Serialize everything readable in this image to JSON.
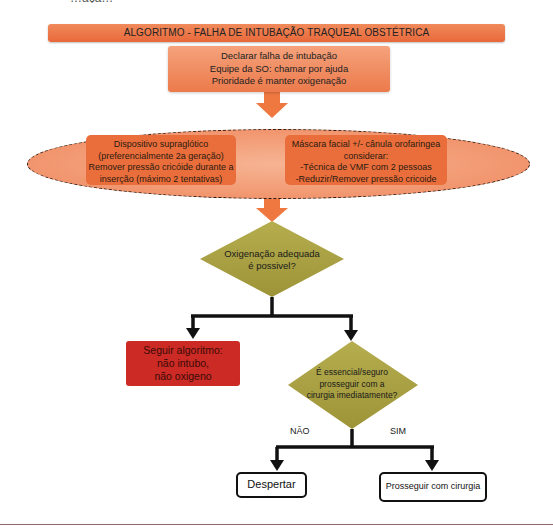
{
  "header": {
    "cut_text": "…açã…",
    "title": "ALGORITMO - FALHA DE INTUBAÇÃO TRAQUEAL OBSTÉTRICA"
  },
  "declare_box": {
    "lines": [
      "Declarar falha de intubação",
      "Equipe da SO: chamar por ajuda",
      "Prioridade é manter oxigenação"
    ]
  },
  "ellipse": {
    "left_box": {
      "lines": [
        "Dispositivo supraglótico",
        "(preferencialmente 2a geração)",
        "Remover pressão cricóide durante a",
        "inserção (máximo 2 tentativas)"
      ]
    },
    "right_box": {
      "lines": [
        "Máscara facial +/- cânula orofaringea",
        "considerar:",
        "-Técnica de VMF com 2 pessoas",
        "-Reduzir/Remover pressão cricoide"
      ]
    }
  },
  "decision1": {
    "lines": [
      "Oxigenação adequada",
      "é possivel?"
    ]
  },
  "red_box": {
    "lines": [
      "Seguir algoritmo:",
      "não intubo,",
      "não oxigeno"
    ]
  },
  "decision2": {
    "lines": [
      "É essencial/seguro",
      "prosseguir com a",
      "cirurgia imediatamente?"
    ]
  },
  "branches": {
    "no_label": "NÃO",
    "yes_label": "SIM"
  },
  "outcomes": {
    "wake": "Despertar",
    "proceed": "Prosseguir com cirurgia"
  },
  "colors": {
    "orange_dark": "#e8683a",
    "orange_light": "#f5a27c",
    "olive": "#a8a040",
    "red": "#cc2a24",
    "arrow_orange": "#ef7740",
    "connector": "#111111"
  }
}
